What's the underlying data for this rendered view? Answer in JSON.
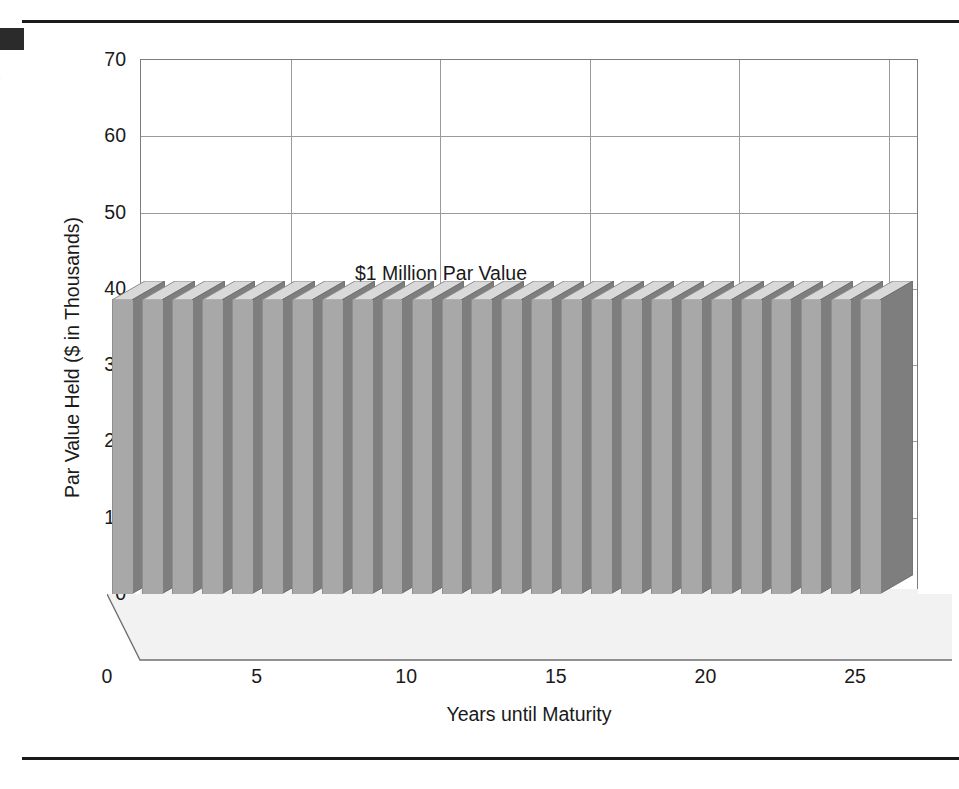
{
  "figure": {
    "artifacts": {
      "corner_block": "black-corner-mark",
      "edge_glyph": ")"
    }
  },
  "chart_data": {
    "type": "bar",
    "title": "",
    "subtitle": "",
    "annotation": "$1 Million Par Value",
    "xlabel": "Years until Maturity",
    "ylabel": "Par Value Held ($ in Thousands)",
    "xlim": [
      0,
      26
    ],
    "ylim": [
      0,
      70
    ],
    "xticks": [
      "0",
      "5",
      "10",
      "15",
      "20",
      "25"
    ],
    "xtick_values": [
      0,
      5,
      10,
      15,
      20,
      25
    ],
    "yticks": [
      "0",
      "10",
      "20",
      "30",
      "40",
      "50",
      "60",
      "70"
    ],
    "ytick_values": [
      0,
      10,
      20,
      30,
      40,
      50,
      60,
      70
    ],
    "grid": "both",
    "legend": "none",
    "three_d": true,
    "categories": [
      0,
      1,
      2,
      3,
      4,
      5,
      6,
      7,
      8,
      9,
      10,
      11,
      12,
      13,
      14,
      15,
      16,
      17,
      18,
      19,
      20,
      21,
      22,
      23,
      24,
      25
    ],
    "values": [
      38.5,
      38.5,
      38.5,
      38.5,
      38.5,
      38.5,
      38.5,
      38.5,
      38.5,
      38.5,
      38.5,
      38.5,
      38.5,
      38.5,
      38.5,
      38.5,
      38.5,
      38.5,
      38.5,
      38.5,
      38.5,
      38.5,
      38.5,
      38.5,
      38.5,
      38.5
    ],
    "series": [
      {
        "name": "Par Value Held",
        "values": [
          38.5,
          38.5,
          38.5,
          38.5,
          38.5,
          38.5,
          38.5,
          38.5,
          38.5,
          38.5,
          38.5,
          38.5,
          38.5,
          38.5,
          38.5,
          38.5,
          38.5,
          38.5,
          38.5,
          38.5,
          38.5,
          38.5,
          38.5,
          38.5,
          38.5,
          38.5
        ]
      }
    ],
    "colors": {
      "bar_front": "#a8a8a8",
      "bar_side": "#7e7e7e",
      "bar_top": "#d8d8d8",
      "grid": "#9a9a9a",
      "frame": "#7d7d7d",
      "text": "#1a1a1a",
      "floor": "#efefef"
    }
  }
}
